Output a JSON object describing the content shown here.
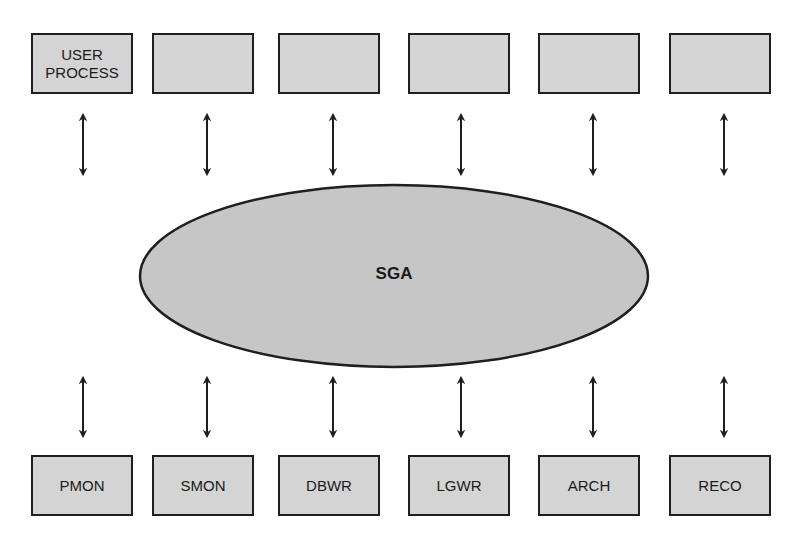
{
  "diagram": {
    "center": {
      "label": "SGA",
      "shape": "ellipse",
      "fill": "#c6c6c6"
    },
    "top_row": [
      {
        "label": "USER\nPROCESS"
      },
      {
        "label": ""
      },
      {
        "label": ""
      },
      {
        "label": ""
      },
      {
        "label": ""
      },
      {
        "label": ""
      }
    ],
    "bottom_row": [
      {
        "label": "PMON"
      },
      {
        "label": "SMON"
      },
      {
        "label": "DBWR"
      },
      {
        "label": "LGWR"
      },
      {
        "label": "ARCH"
      },
      {
        "label": "RECO"
      }
    ],
    "connectors": "bidirectional arrows between each box and SGA",
    "colors": {
      "box_fill": "#d4d4d4",
      "stroke": "#1f1f1f"
    }
  }
}
